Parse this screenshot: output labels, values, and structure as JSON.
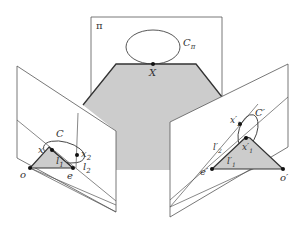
{
  "figure": {
    "type": "epipolar-geometry-diagram",
    "colors": {
      "line": "#555555",
      "edge": "#333333",
      "fill": "#cccccc",
      "point": "#111111",
      "background": "#ffffff"
    },
    "labels": {
      "plane": "π",
      "world_conic": "C",
      "world_conic_sub": "π",
      "world_point": "X",
      "left_conic": "C",
      "left_point": "x",
      "left_x2": "x",
      "left_x2_sub": "2",
      "left_l1": "l",
      "left_l1_sub": "1",
      "left_l2": "l",
      "left_l2_sub": "2",
      "left_center": "o",
      "left_epipole": "e",
      "right_conic": "C′",
      "right_x2": "x′",
      "right_x2_sub": "2",
      "right_x1": "x′",
      "right_x1_sub": "1",
      "right_l2": "l′",
      "right_l2_sub": "2",
      "right_l1": "l′",
      "right_l1_sub": "1",
      "right_epipole": "e′",
      "right_center": "o′"
    }
  }
}
